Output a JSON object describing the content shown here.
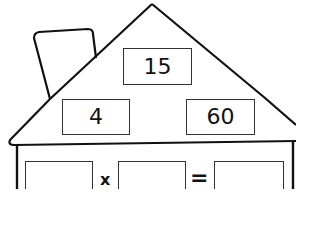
{
  "fact_family_house": {
    "roof_top": {
      "value": "15"
    },
    "roof_left": {
      "value": "4"
    },
    "roof_right": {
      "value": "60"
    },
    "equation_row": {
      "operand_1": "",
      "operator": "x",
      "operand_2": "",
      "equals": "=",
      "result": ""
    }
  },
  "colors": {
    "line": "#111111",
    "background": "#ffffff"
  }
}
